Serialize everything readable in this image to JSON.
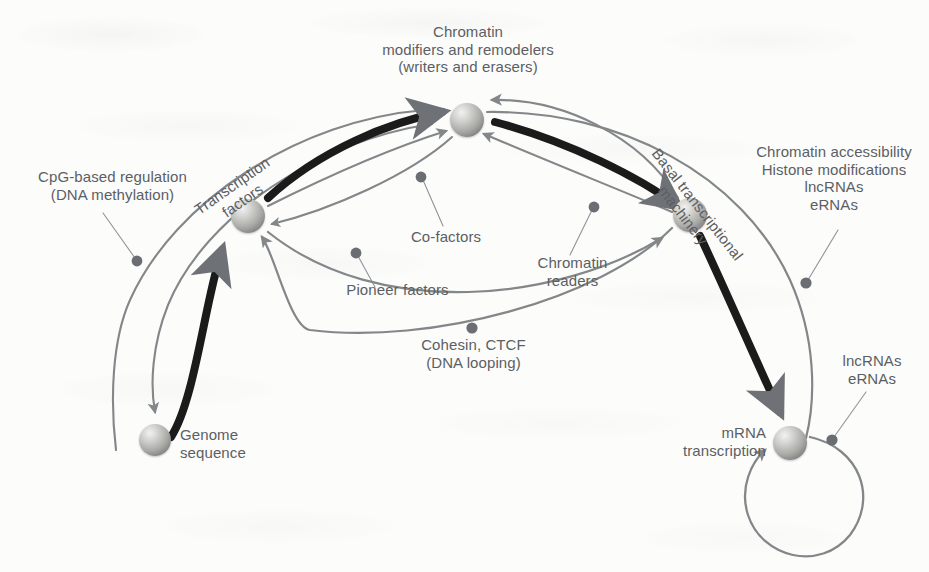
{
  "figure": {
    "background_color": "#fcfcfb",
    "label_color": "#5b5f63",
    "edge_gray": "#808487",
    "edge_black": "#1a1a1a"
  },
  "nodes": [
    {
      "id": "chromatin",
      "name": "chromatin-modifiers-node",
      "label": "Chromatin\nmodifiers and remodelers\n(writers and erasers)",
      "x": 467,
      "y": 120,
      "r": 17
    },
    {
      "id": "tf",
      "name": "transcription-factors-node",
      "label": "Transcription\nfactors",
      "x": 248,
      "y": 216,
      "r": 17
    },
    {
      "id": "basal",
      "name": "basal-machinery-node",
      "label": "Basal transcriptional\nmachinery",
      "x": 690,
      "y": 215,
      "r": 17
    },
    {
      "id": "genome",
      "name": "genome-sequence-node",
      "label": "Genome\nsequence",
      "x": 155,
      "y": 440,
      "r": 16
    },
    {
      "id": "mrna",
      "name": "mrna-transcription-node",
      "label": "mRNA\ntranscription",
      "x": 790,
      "y": 443,
      "r": 17
    }
  ],
  "node_labels": [
    {
      "id": "chromatin-label",
      "text": "Chromatin\nmodifiers and remodelers\n(writers and erasers)",
      "align": "center"
    },
    {
      "id": "tf-label",
      "text": "Transcription\nfactors",
      "align": "center",
      "rotation": -35
    },
    {
      "id": "basal-label",
      "text": "Basal transcriptional\nmachinery",
      "align": "center",
      "rotation": 52
    },
    {
      "id": "genome-label",
      "text": "Genome\nsequence",
      "align": "left"
    },
    {
      "id": "mrna-label",
      "text": "mRNA\ntranscription",
      "align": "right"
    }
  ],
  "annotations": [
    {
      "id": "cpg",
      "name": "cpg-annotation",
      "text": "CpG-based regulation\n(DNA methylation)",
      "align": "center"
    },
    {
      "id": "cofactors",
      "name": "co-factors-annotation",
      "text": "Co-factors",
      "align": "center"
    },
    {
      "id": "pioneer",
      "name": "pioneer-factors-annotation",
      "text": "Pioneer factors",
      "align": "center"
    },
    {
      "id": "readers",
      "name": "chromatin-readers-annotation",
      "text": "Chromatin\nreaders",
      "align": "center"
    },
    {
      "id": "cohesin",
      "name": "cohesin-ctcf-annotation",
      "text": "Cohesin, CTCF\n(DNA looping)",
      "align": "center"
    },
    {
      "id": "accessib",
      "name": "chromatin-accessibility-annotation",
      "text": "Chromatin accessibility\nHistone modifications\nlncRNAs\neRNAs",
      "align": "center"
    },
    {
      "id": "rnas",
      "name": "lncrnas-ernas-annotation",
      "text": "lncRNAs\neRNAs",
      "align": "center"
    }
  ],
  "edges": [
    {
      "id": "genome-to-tf",
      "name": "edge-genome-to-transcription-factors",
      "style": "black",
      "from": "genome",
      "to": "tf"
    },
    {
      "id": "tf-to-chromatin",
      "name": "edge-transcription-factors-to-chromatin",
      "style": "black",
      "from": "tf",
      "to": "chromatin"
    },
    {
      "id": "chromatin-to-basal",
      "name": "edge-chromatin-to-basal-machinery",
      "style": "black",
      "from": "chromatin",
      "to": "basal"
    },
    {
      "id": "basal-to-mrna",
      "name": "edge-basal-machinery-to-mrna",
      "style": "black",
      "from": "basal",
      "to": "mrna"
    },
    {
      "id": "cpg-arc",
      "name": "edge-cpg-regulation-to-genome",
      "style": "gray",
      "from": "chromatin",
      "to": "genome"
    },
    {
      "id": "cpg-arc-2",
      "name": "edge-cpg-regulation-outer",
      "style": "gray",
      "from": "chromatin",
      "to": "genome"
    },
    {
      "id": "cofactors-arc",
      "name": "edge-co-factors-to-chromatin",
      "style": "gray",
      "from": "tf",
      "to": "chromatin"
    },
    {
      "id": "pioneer-arc",
      "name": "edge-pioneer-factors-to-transcription-factors",
      "style": "gray",
      "from": "chromatin",
      "to": "tf"
    },
    {
      "id": "readers-arc",
      "name": "edge-chromatin-readers-to-chromatin",
      "style": "gray",
      "from": "basal",
      "to": "chromatin"
    },
    {
      "id": "chromatin-back-arc",
      "name": "edge-basal-machinery-to-chromatin",
      "style": "gray",
      "from": "basal",
      "to": "chromatin"
    },
    {
      "id": "cohesin-arc",
      "name": "edge-cohesin-ctcf-to-transcription-factors",
      "style": "gray",
      "from": "basal",
      "to": "tf"
    },
    {
      "id": "tf-to-basal-arc",
      "name": "edge-transcription-factors-to-basal-machinery",
      "style": "gray",
      "from": "tf",
      "to": "basal"
    },
    {
      "id": "accessibility-arc",
      "name": "edge-chromatin-accessibility-to-mrna",
      "style": "gray",
      "from": "chromatin",
      "to": "mrna"
    },
    {
      "id": "mrna-selfloop",
      "name": "edge-mrna-self-loop",
      "style": "gray",
      "from": "mrna",
      "to": "mrna"
    }
  ]
}
